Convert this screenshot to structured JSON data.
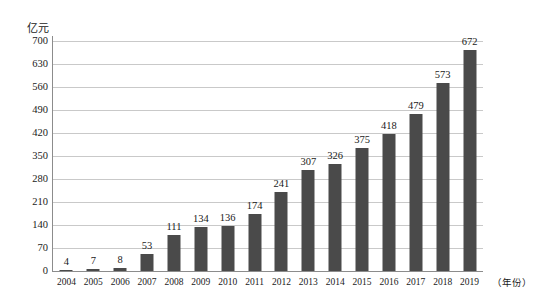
{
  "chart_data": {
    "type": "bar",
    "title": "",
    "subtitle": "",
    "xlabel": "（年份）",
    "ylabel": "亿元",
    "categories": [
      "2004",
      "2005",
      "2006",
      "2007",
      "2008",
      "2009",
      "2010",
      "2011",
      "2012",
      "2013",
      "2014",
      "2015",
      "2016",
      "2017",
      "2018",
      "2019"
    ],
    "values": [
      4,
      7,
      8,
      53,
      111,
      134,
      136,
      174,
      241,
      307,
      326,
      375,
      418,
      479,
      573,
      672
    ],
    "value_labels": [
      "4",
      "7",
      "8",
      "53",
      "111",
      "134",
      "136",
      "174",
      "241",
      "307",
      "326",
      "375",
      "418",
      "479",
      "573",
      "672"
    ],
    "ylim": [
      0,
      700
    ],
    "y_ticks": [
      0,
      70,
      140,
      210,
      280,
      350,
      420,
      490,
      560,
      630,
      700
    ],
    "y_tick_labels": [
      "0",
      "70",
      "140",
      "210",
      "280",
      "350",
      "420",
      "490",
      "560",
      "630",
      "700"
    ],
    "grid": true,
    "grid_axis": "y",
    "legend": false,
    "legend_position": "none",
    "bar_color": "#4a4a4a",
    "grid_color": "#c9c9c9",
    "axis_color": "#8c8c8c",
    "background_color": "#ffffff",
    "series": [
      {
        "name": "",
        "values": [
          4,
          7,
          8,
          53,
          111,
          134,
          136,
          174,
          241,
          307,
          326,
          375,
          418,
          479,
          573,
          672
        ]
      }
    ]
  }
}
